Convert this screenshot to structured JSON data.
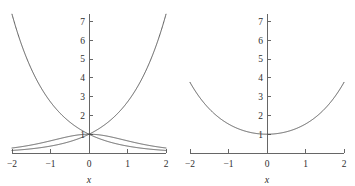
{
  "figure": {
    "background": "#ffffff",
    "curve_color": "#4a4a4a",
    "axis_color": "#666666",
    "label_color": "#2e2e2e"
  },
  "chart_data": [
    {
      "type": "line",
      "title": "",
      "xlabel": "x",
      "ylabel": "",
      "xlim": [
        -2,
        2
      ],
      "ylim": [
        0,
        7.4
      ],
      "grid": false,
      "legend": "none",
      "xticks": [
        -2,
        -1,
        0,
        1,
        2
      ],
      "xticklabels": [
        "−2",
        "−1",
        "0",
        "1",
        "2"
      ],
      "yticks": [
        1,
        2,
        3,
        4,
        5,
        6,
        7
      ],
      "yticklabels": [
        "1",
        "2",
        "3",
        "4",
        "5",
        "6",
        "7"
      ],
      "series": [
        {
          "name": "e^x",
          "x": [
            -2,
            -1.75,
            -1.5,
            -1.25,
            -1,
            -0.75,
            -0.5,
            -0.25,
            0,
            0.25,
            0.5,
            0.75,
            1,
            1.25,
            1.5,
            1.75,
            2
          ],
          "values": [
            0.135,
            0.174,
            0.223,
            0.287,
            0.368,
            0.472,
            0.607,
            0.779,
            1.0,
            1.284,
            1.649,
            2.117,
            2.718,
            3.49,
            4.482,
            5.755,
            7.389
          ]
        },
        {
          "name": "e^-x",
          "x": [
            -2,
            -1.75,
            -1.5,
            -1.25,
            -1,
            -0.75,
            -0.5,
            -0.25,
            0,
            0.25,
            0.5,
            0.75,
            1,
            1.25,
            1.5,
            1.75,
            2
          ],
          "values": [
            7.389,
            5.755,
            4.482,
            3.49,
            2.718,
            2.117,
            1.649,
            1.284,
            1.0,
            0.779,
            0.607,
            0.472,
            0.368,
            0.287,
            0.223,
            0.174,
            0.135
          ]
        },
        {
          "name": "sech x",
          "x": [
            -2,
            -1.75,
            -1.5,
            -1.25,
            -1,
            -0.75,
            -0.5,
            -0.25,
            0,
            0.25,
            0.5,
            0.75,
            1,
            1.25,
            1.5,
            1.75,
            2
          ],
          "values": [
            0.266,
            0.337,
            0.425,
            0.531,
            0.648,
            0.771,
            0.887,
            0.97,
            1.0,
            0.97,
            0.887,
            0.771,
            0.648,
            0.531,
            0.425,
            0.337,
            0.266
          ]
        }
      ]
    },
    {
      "type": "line",
      "title": "",
      "xlabel": "x",
      "ylabel": "",
      "xlim": [
        -2,
        2
      ],
      "ylim": [
        0,
        7.4
      ],
      "grid": false,
      "legend": "none",
      "xticks": [
        -2,
        -1,
        0,
        1,
        2
      ],
      "xticklabels": [
        "−2",
        "−1",
        "0",
        "1",
        "2"
      ],
      "yticks": [
        1,
        2,
        3,
        4,
        5,
        6,
        7
      ],
      "yticklabels": [
        "1",
        "2",
        "3",
        "4",
        "5",
        "6",
        "7"
      ],
      "series": [
        {
          "name": "cosh x",
          "x": [
            -2,
            -1.75,
            -1.5,
            -1.25,
            -1,
            -0.75,
            -0.5,
            -0.25,
            0,
            0.25,
            0.5,
            0.75,
            1,
            1.25,
            1.5,
            1.75,
            2
          ],
          "values": [
            3.762,
            2.964,
            2.352,
            1.888,
            1.543,
            1.294,
            1.128,
            1.031,
            1.0,
            1.031,
            1.128,
            1.294,
            1.543,
            1.888,
            2.352,
            2.964,
            3.762
          ]
        }
      ]
    }
  ]
}
